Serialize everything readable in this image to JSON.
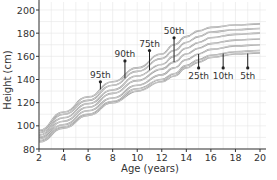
{
  "chart_data": {
    "type": "line",
    "title": "",
    "xlabel": "Age (years)",
    "ylabel": "Height (cm)",
    "xlim": [
      2,
      20
    ],
    "ylim": [
      80,
      200
    ],
    "xticks": [
      2,
      4,
      6,
      8,
      10,
      12,
      14,
      16,
      18,
      20
    ],
    "yticks": [
      80,
      100,
      120,
      140,
      160,
      180,
      200
    ],
    "grid": true,
    "legend": "none",
    "x": [
      2,
      4,
      6,
      8,
      10,
      12,
      13,
      14,
      15,
      16,
      18,
      20
    ],
    "series": [
      {
        "name": "95th",
        "values": [
          96,
          112,
          125,
          138,
          150,
          162,
          170,
          177,
          182,
          185,
          187,
          188
        ]
      },
      {
        "name": "90th",
        "values": [
          94,
          110,
          122,
          135,
          147,
          158,
          165,
          172,
          177,
          181,
          183,
          184
        ]
      },
      {
        "name": "75th",
        "values": [
          92,
          107,
          119,
          131,
          143,
          153,
          160,
          167,
          172,
          176,
          179,
          180
        ]
      },
      {
        "name": "50th",
        "values": [
          90,
          104,
          116,
          128,
          139,
          149,
          155,
          162,
          167,
          171,
          174,
          175
        ]
      },
      {
        "name": "25th",
        "values": [
          89,
          101,
          113,
          124,
          135,
          144,
          150,
          157,
          162,
          166,
          169,
          170
        ]
      },
      {
        "name": "10th",
        "values": [
          87,
          99,
          110,
          121,
          132,
          140,
          145,
          152,
          157,
          161,
          164,
          165
        ]
      },
      {
        "name": "5th",
        "values": [
          86,
          98,
          109,
          120,
          130,
          138,
          143,
          150,
          155,
          159,
          162,
          163
        ]
      }
    ],
    "annotations": [
      {
        "label": "95th",
        "x": 7,
        "y_top": 138,
        "label_pos": "above"
      },
      {
        "label": "90th",
        "x": 9,
        "y_top": 156,
        "label_pos": "above"
      },
      {
        "label": "75th",
        "x": 11,
        "y_top": 165,
        "label_pos": "above"
      },
      {
        "label": "50th",
        "x": 13,
        "y_top": 176,
        "label_pos": "above"
      },
      {
        "label": "25th",
        "x": 15,
        "y_bottom": 150,
        "label_pos": "below"
      },
      {
        "label": "10th",
        "x": 17,
        "y_bottom": 150,
        "label_pos": "below"
      },
      {
        "label": "5th",
        "x": 19,
        "y_bottom": 150,
        "label_pos": "below"
      }
    ]
  },
  "colors": {
    "curve": "#9a9a9a",
    "axis": "#333333",
    "grid": "#e6e6e6",
    "marker": "#222222"
  }
}
